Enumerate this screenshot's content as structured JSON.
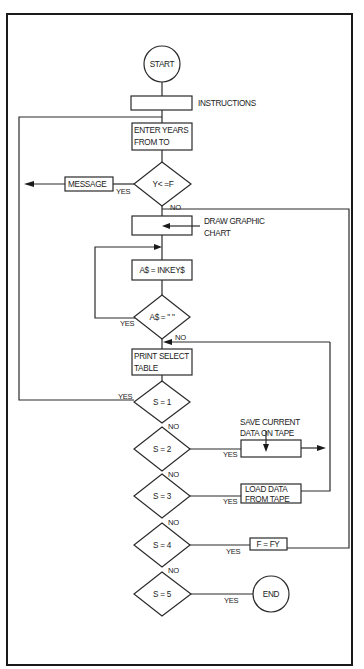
{
  "flowchart": {
    "start": "START",
    "end": "END",
    "instructions": "INSTRUCTIONS",
    "enter_years": {
      "line1": "ENTER YEARS",
      "line2": "FROM TO"
    },
    "check_years": "Y< =F",
    "message": "MESSAGE",
    "draw_chart": {
      "line1": "DRAW GRAPHIC",
      "line2": "CHART"
    },
    "inkey": "A$ = INKEY$",
    "check_key": "A$ = \" \"",
    "print_table": {
      "line1": "PRINT SELECT",
      "line2": "TABLE"
    },
    "decisions": [
      {
        "label": "S = 1"
      },
      {
        "label": "S = 2"
      },
      {
        "label": "S = 3"
      },
      {
        "label": "S = 4"
      },
      {
        "label": "S = 5"
      }
    ],
    "save_data": {
      "line1": "SAVE CURRENT",
      "line2": "DATA ON TAPE"
    },
    "load_data": {
      "line1": "LOAD DATA",
      "line2": "FROM TAPE"
    },
    "set_f": "F = FY",
    "yes": "YES",
    "no": "NO"
  }
}
